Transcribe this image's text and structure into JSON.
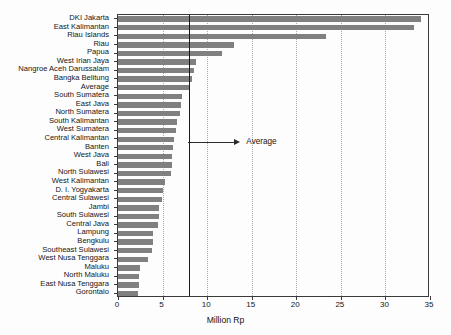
{
  "chart_data": {
    "type": "bar",
    "orientation": "horizontal",
    "title": "",
    "xlabel": "Million Rp",
    "ylabel": "",
    "xlim": [
      0,
      35
    ],
    "xticks": [
      0,
      5,
      10,
      15,
      20,
      25,
      30,
      35
    ],
    "xticklabels": [
      "0",
      "5",
      "10",
      "15",
      "20",
      "25",
      "30",
      "35"
    ],
    "grid": "vertical-dotted",
    "legend": "none",
    "bar_color": "#808080",
    "axis_color": "#3a3a3a",
    "gridline_color": "#a9a9a9",
    "categories": [
      "DKI Jakarta",
      "East Kalimantan",
      "Riau Islands",
      "Riau",
      "Papua",
      "West Irian Jaya",
      "Nangroe Aceh Darussalam",
      "Bangka Belitung",
      "Average",
      "South Sumatera",
      "East Java",
      "North Sumatera",
      "South Kalimantan",
      "West Sumatera",
      "Central Kalimantan",
      "Banten",
      "West Java",
      "Bali",
      "North Sulawesi",
      "West Kalimantan",
      "D. I. Yogyakarta",
      "Central Sulawesi",
      "Jambi",
      "South Sulawesi",
      "Central Java",
      "Lampung",
      "Bengkulu",
      "Southeast Sulawesi",
      "West Nusa Tenggara",
      "Maluku",
      "North Maluku",
      "East Nusa Tenggara",
      "Gorontalo"
    ],
    "values": [
      34.0,
      33.2,
      23.3,
      13.0,
      11.7,
      8.7,
      8.5,
      8.3,
      8.0,
      7.2,
      7.1,
      7.0,
      6.6,
      6.5,
      6.3,
      6.2,
      6.1,
      6.1,
      5.9,
      5.3,
      5.1,
      4.9,
      4.6,
      4.6,
      4.5,
      3.9,
      3.9,
      3.8,
      3.4,
      2.5,
      2.4,
      2.3,
      2.2
    ],
    "annotations": [
      {
        "name": "average-reference-line",
        "label": "Average",
        "value": 8.0,
        "style": "vertical solid black line with leftward arrow"
      }
    ]
  }
}
